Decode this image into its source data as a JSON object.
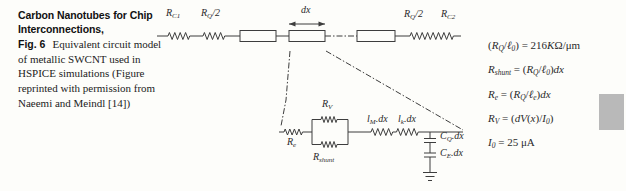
{
  "caption": {
    "title": "Carbon Nanotubes for Chip Interconnections,",
    "fig_label": "Fig. 6",
    "body": "Equivalent circuit model of metallic SWCNT used in HSPICE simulations (Figure reprinted with permission from Naeemi and Meindl [14])"
  },
  "circuit": {
    "labels": {
      "rc1": {
        "base": "R",
        "sub": "C1"
      },
      "rq2_left": {
        "base": "R",
        "sub": "Q",
        "suffix": "/2"
      },
      "dx": {
        "base": "dx"
      },
      "rq2_right": {
        "base": "R",
        "sub": "Q",
        "suffix": "/2"
      },
      "rc2": {
        "base": "R",
        "sub": "C2"
      },
      "re": {
        "base": "R",
        "sub": "e"
      },
      "rv": {
        "base": "R",
        "sub": "V"
      },
      "rshunt": {
        "base": "R",
        "sub": "shunt"
      },
      "lm": {
        "base": "l",
        "sub": "M",
        "suffix": ".dx"
      },
      "lk": {
        "base": "l",
        "sub": "k",
        "suffix": ".dx"
      },
      "cq": {
        "base": "C",
        "sub": "Q",
        "suffix": ".dx"
      },
      "ce": {
        "base": "C",
        "sub": "E",
        "suffix": ".dx"
      }
    }
  },
  "equations": {
    "lines": [
      {
        "parts": [
          {
            "c": "n",
            "t": "("
          },
          {
            "c": "i",
            "t": "R"
          },
          {
            "c": "s",
            "t": "Q"
          },
          {
            "c": "n",
            "t": "/"
          },
          {
            "c": "i",
            "t": "ℓ"
          },
          {
            "c": "s",
            "t": "0"
          },
          {
            "c": "n",
            "t": ") = 216"
          },
          {
            "c": "i",
            "t": "K"
          },
          {
            "c": "n",
            "t": "Ω/μm"
          }
        ]
      },
      {
        "parts": [
          {
            "c": "i",
            "t": "R"
          },
          {
            "c": "s",
            "t": "shunt"
          },
          {
            "c": "n",
            "t": " = ("
          },
          {
            "c": "i",
            "t": "R"
          },
          {
            "c": "s",
            "t": "Q"
          },
          {
            "c": "n",
            "t": "/"
          },
          {
            "c": "i",
            "t": "ℓ"
          },
          {
            "c": "s",
            "t": "0"
          },
          {
            "c": "n",
            "t": ")"
          },
          {
            "c": "i",
            "t": "dx"
          }
        ]
      },
      {
        "parts": [
          {
            "c": "i",
            "t": "R"
          },
          {
            "c": "s",
            "t": "e"
          },
          {
            "c": "n",
            "t": " = ("
          },
          {
            "c": "i",
            "t": "R"
          },
          {
            "c": "s",
            "t": "Q"
          },
          {
            "c": "n",
            "t": "/"
          },
          {
            "c": "i",
            "t": "ℓ"
          },
          {
            "c": "s",
            "t": "e"
          },
          {
            "c": "n",
            "t": ")"
          },
          {
            "c": "i",
            "t": "dx"
          }
        ]
      },
      {
        "parts": [
          {
            "c": "i",
            "t": "R"
          },
          {
            "c": "s",
            "t": "V"
          },
          {
            "c": "n",
            "t": " = ("
          },
          {
            "c": "i",
            "t": "dV"
          },
          {
            "c": "n",
            "t": "("
          },
          {
            "c": "i",
            "t": "x"
          },
          {
            "c": "n",
            "t": ")/"
          },
          {
            "c": "i",
            "t": "I"
          },
          {
            "c": "s",
            "t": "0"
          },
          {
            "c": "n",
            "t": ")"
          }
        ]
      },
      {
        "parts": [
          {
            "c": "i",
            "t": "I"
          },
          {
            "c": "s",
            "t": "0"
          },
          {
            "c": "n",
            "t": " = 25 μA"
          }
        ]
      }
    ]
  },
  "colors": {
    "paper": "#fdfdfa",
    "ink": "#3d3d3d",
    "scrollbar_thumb": "#b9b9b9"
  }
}
